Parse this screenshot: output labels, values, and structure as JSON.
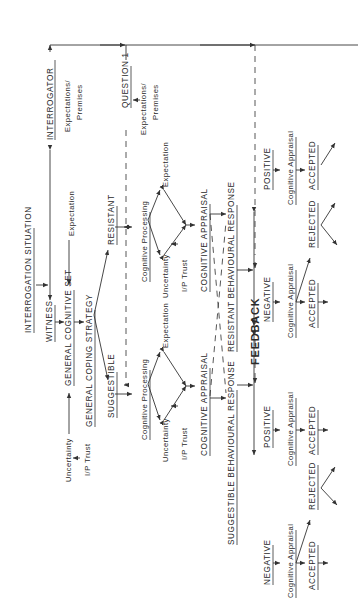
{
  "diagram": {
    "orientation": "rotated 90deg counter-clockwise",
    "nodes": {
      "interrogator": "INTERROGATOR",
      "interrogator_expectations": "Expectations/",
      "interrogator_premises": "Premises",
      "interrogation_situation": "INTERROGATION SITUATION",
      "witness": "WITNESS",
      "general_cognitive_set": "GENERAL COGNITIVE SET",
      "gcs_expectation": "Expectation",
      "general_coping_strategy": "GENERAL COPING STRATEGY",
      "gcs_uncertainty": "Uncertainty",
      "gcs_ip_trust": "I/P Trust",
      "suggestible": "SUGGESTIBLE",
      "resistant": "RESISTANT",
      "question_1": "QUESTION 1",
      "question_expectations": "Expectations/",
      "question_premises": "Premises",
      "sugg_cognitive_processing": "Cognitive Processing",
      "sugg_uncertainty": "Uncertainty",
      "sugg_ip_trust": "I/P Trust",
      "sugg_expectation": "Expectation",
      "res_cognitive_processing": "Cognitive Processing",
      "res_uncertainty": "Uncertainty",
      "res_ip_trust": "I/P Trust",
      "res_expectation": "Expectation",
      "sugg_cognitive_appraisal": "COGNITIVE APPRAISAL",
      "res_cognitive_appraisal": "COGNITIVE APPRAISAL",
      "suggestible_behavioural_response": "SUGGESTIBLE BEHAVIOURAL RESPONSE",
      "resistant_behavioural_response": "RESISTANT BEHAVIOURAL RESPONSE",
      "feedback": "FEEDBACK",
      "sugg_negative": "NEGATIVE",
      "sugg_positive": "POSITIVE",
      "res_negative": "NEGATIVE",
      "res_positive": "POSITIVE",
      "sugg_neg_appraisal": "Cognitive Appraisal",
      "sugg_pos_appraisal": "Cognitive Appraisal",
      "res_neg_appraisal": "Cognitive Appraisal",
      "res_pos_appraisal": "Cognitive Appraisal",
      "sugg_neg_accepted": "ACCEPTED",
      "sugg_neg_rejected": "REJECTED",
      "sugg_pos_accepted": "ACCEPTED",
      "res_neg_accepted": "ACCEPTED",
      "res_neg_rejected": "REJECTED",
      "res_pos_accepted": "ACCEPTED"
    }
  }
}
